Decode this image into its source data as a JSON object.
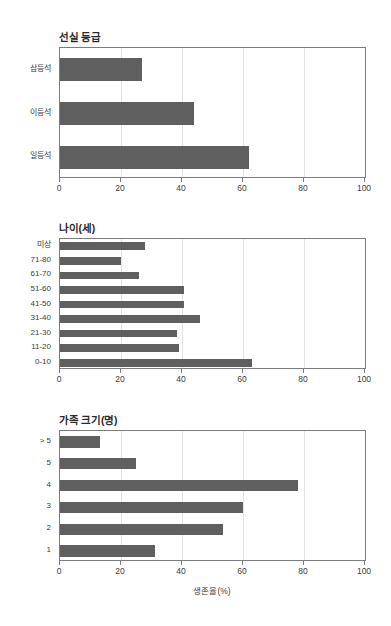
{
  "figure": {
    "background": "#ffffff",
    "bar_color": "#5f5f5f",
    "axis_color": "#7c7c7c",
    "grid_color": "#e3e3e3"
  },
  "chart_data": [
    {
      "type": "bar",
      "orientation": "horizontal",
      "title": "선실 등급",
      "xlabel": "",
      "ylabel": "",
      "xlim": [
        0,
        100
      ],
      "xticks": [
        0,
        20,
        40,
        60,
        80,
        100
      ],
      "xticklabels": [
        "0",
        "20",
        "40",
        "60",
        "80",
        "100"
      ],
      "grid": true,
      "legend": null,
      "categories": [
        "삼등석",
        "이등석",
        "일등석"
      ],
      "values": [
        27,
        44,
        62
      ]
    },
    {
      "type": "bar",
      "orientation": "horizontal",
      "title": "나이(세)",
      "xlabel": "",
      "ylabel": "",
      "xlim": [
        0,
        100
      ],
      "xticks": [
        0,
        20,
        40,
        60,
        80,
        100
      ],
      "xticklabels": [
        "0",
        "20",
        "40",
        "60",
        "80",
        "100"
      ],
      "grid": true,
      "legend": null,
      "categories": [
        "미상",
        "71-80",
        "61-70",
        "51-60",
        "41-50",
        "31-40",
        "21-30",
        "11-20",
        "0-10"
      ],
      "values": [
        28,
        20,
        26,
        40.5,
        40.5,
        46,
        38.5,
        39,
        63
      ]
    },
    {
      "type": "bar",
      "orientation": "horizontal",
      "title": "가족 크기(명)",
      "xlabel": "생존율(%)",
      "ylabel": "",
      "xlim": [
        0,
        100
      ],
      "xticks": [
        0,
        20,
        40,
        60,
        80,
        100
      ],
      "xticklabels": [
        "0",
        "20",
        "40",
        "60",
        "80",
        "100"
      ],
      "grid": true,
      "legend": null,
      "categories": [
        "> 5",
        "5",
        "4",
        "3",
        "2",
        "1"
      ],
      "values": [
        13,
        25,
        78,
        60,
        53.5,
        31
      ]
    }
  ]
}
